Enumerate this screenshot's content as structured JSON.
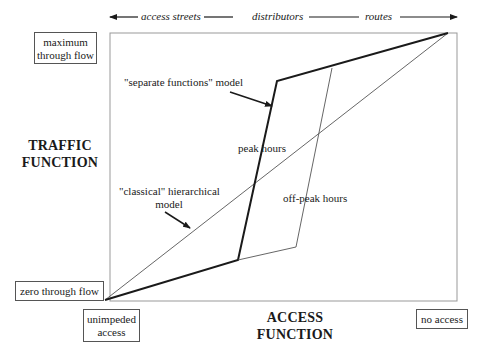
{
  "top_axis": {
    "labels": [
      "access streets",
      "distributors",
      "routes"
    ]
  },
  "y_axis": {
    "title_line1": "TRAFFIC",
    "title_line2": "FUNCTION",
    "max_label_line1": "maximum",
    "max_label_line2": "through flow",
    "min_label": "zero through flow"
  },
  "x_axis": {
    "title_line1": "ACCESS",
    "title_line2": "FUNCTION",
    "min_label_line1": "unimpeded",
    "min_label_line2": "access",
    "max_label": "no access"
  },
  "annotations": {
    "separate_model": "\"separate functions\" model",
    "peak_hours": "peak hours",
    "off_peak_hours": "off-peak hours",
    "classical_line1": "\"classical\" hierarchical",
    "classical_line2": "model"
  },
  "colors": {
    "line": "#1a1a1a",
    "thin_line": "#555555",
    "frame": "#999999"
  }
}
